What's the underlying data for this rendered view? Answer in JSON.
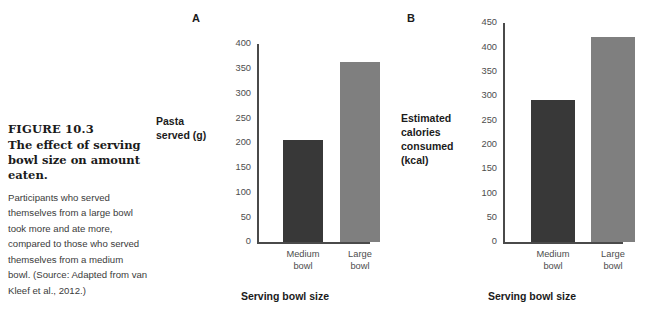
{
  "figure": {
    "number": "FIGURE 10.3",
    "title": "The effect of serving bowl size on amount eaten.",
    "body": "Participants who served themselves from a large bowl took more and ate more, compared to those who served themselves from a medium bowl. (Source: Adapted from van Kleef et al., 2012.)"
  },
  "colors": {
    "bar_medium": "#383838",
    "bar_large": "#7f7f7f",
    "axis": "#4a4a4a",
    "tick_text": "#4d4d4d",
    "label_text": "#1b1b1b",
    "body_text": "#3b3b3b",
    "background": "#ffffff"
  },
  "panels": [
    {
      "letter": "A",
      "ylabel_lines": [
        "Pasta",
        "served (g)"
      ],
      "xlabel": "Serving bowl size",
      "ticks": [
        "400",
        "350",
        "300",
        "250",
        "200",
        "150",
        "100",
        "50",
        "0"
      ],
      "categories": [
        {
          "line1": "Medium",
          "line2": "bowl"
        },
        {
          "line1": "Large",
          "line2": "bowl"
        }
      ]
    },
    {
      "letter": "B",
      "ylabel_lines": [
        "Estimated",
        "calories",
        "consumed",
        "(kcal)"
      ],
      "xlabel": "Serving bowl size",
      "ticks": [
        "450",
        "400",
        "350",
        "300",
        "250",
        "200",
        "150",
        "100",
        "50",
        "0"
      ],
      "categories": [
        {
          "line1": "Medium",
          "line2": "bowl"
        },
        {
          "line1": "Large",
          "line2": "bowl"
        }
      ]
    }
  ],
  "chart_data": [
    {
      "type": "bar",
      "title": "A",
      "categories": [
        "Medium bowl",
        "Large bowl"
      ],
      "values": [
        206,
        364
      ],
      "xlabel": "Serving bowl size",
      "ylabel": "Pasta served (g)",
      "ylim": [
        0,
        400
      ],
      "ytick_step": 50,
      "yticks": [
        0,
        50,
        100,
        150,
        200,
        250,
        300,
        350,
        400
      ],
      "bar_colors": [
        "#383838",
        "#7f7f7f"
      ],
      "grid": false,
      "legend": "none"
    },
    {
      "type": "bar",
      "title": "B",
      "categories": [
        "Medium bowl",
        "Large bowl"
      ],
      "values": [
        291,
        421
      ],
      "xlabel": "Serving bowl size",
      "ylabel": "Estimated calories consumed (kcal)",
      "ylim": [
        0,
        450
      ],
      "ytick_step": 50,
      "yticks": [
        0,
        50,
        100,
        150,
        200,
        250,
        300,
        350,
        400,
        450
      ],
      "bar_colors": [
        "#383838",
        "#7f7f7f"
      ],
      "grid": false,
      "legend": "none"
    }
  ]
}
